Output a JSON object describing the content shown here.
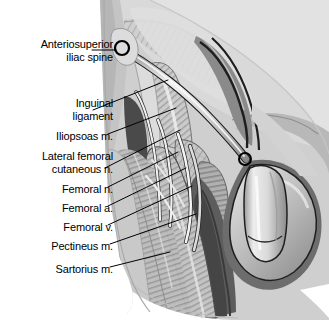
{
  "figure": {
    "type": "anatomical-illustration",
    "view": "anterior",
    "style": "grayscale shaded line drawing",
    "background_color": "#ffffff",
    "line_color": "#000000"
  },
  "labels": [
    {
      "id": "asis",
      "text": "Anteriosuperior\niliac spine",
      "lines": [
        "Anteriosuperior",
        "iliac spine"
      ],
      "right": 113,
      "top": 38,
      "leader_to_x": 122,
      "leader_to_y": 48
    },
    {
      "id": "inguinal",
      "text": "Inguinal\nligament",
      "lines": [
        "Inguinal",
        "ligament"
      ],
      "right": 113,
      "top": 97,
      "leader_to_x": 168,
      "leader_to_y": 80
    },
    {
      "id": "iliopsoas",
      "text": "Iliopsoas m.",
      "lines": [
        "Iliopsoas m."
      ],
      "right": 113,
      "top": 130,
      "leader_to_x": 176,
      "leader_to_y": 108
    },
    {
      "id": "lfcn",
      "text": "Lateral femoral\ncutaneous n.",
      "lines": [
        "Lateral femoral",
        "cutaneous n."
      ],
      "right": 113,
      "top": 150,
      "leader_to_x": 180,
      "leader_to_y": 130
    },
    {
      "id": "femoral_n",
      "text": "Femoral n.",
      "lines": [
        "Femoral n."
      ],
      "right": 113,
      "top": 183,
      "leader_to_x": 178,
      "leader_to_y": 152
    },
    {
      "id": "femoral_a",
      "text": "Femoral a.",
      "lines": [
        "Femoral a."
      ],
      "right": 113,
      "top": 202,
      "leader_to_x": 186,
      "leader_to_y": 168
    },
    {
      "id": "femoral_v",
      "text": "Femoral v.",
      "lines": [
        "Femoral v."
      ],
      "right": 113,
      "top": 221,
      "leader_to_x": 192,
      "leader_to_y": 186
    },
    {
      "id": "pectineus",
      "text": "Pectineus m.",
      "lines": [
        "Pectineus m."
      ],
      "right": 113,
      "top": 240,
      "leader_to_x": 196,
      "leader_to_y": 214
    },
    {
      "id": "sartorius",
      "text": "Sartorius m.",
      "lines": [
        "Sartorius m."
      ],
      "right": 113,
      "top": 263,
      "leader_to_x": 170,
      "leader_to_y": 252
    }
  ],
  "markers": [
    {
      "id": "asis-marker",
      "name": "Anteriosuperior iliac spine",
      "cx": 122,
      "cy": 48,
      "r": 7
    },
    {
      "id": "pubic-tubercle-marker",
      "name": "pubic tubercle",
      "cx": 245,
      "cy": 159,
      "r": 6
    }
  ],
  "palette": {
    "white": "#ffffff",
    "lightest": "#e9e9e9",
    "light": "#dcdcdc",
    "mid_light": "#c9c9c9",
    "mid": "#b4b4b4",
    "mid_dark": "#9b9b9b",
    "dark": "#7e7e7e",
    "darker": "#636363",
    "darkest": "#3c3c3c",
    "outline": "#000000",
    "highlight": "#f4f4f4"
  }
}
